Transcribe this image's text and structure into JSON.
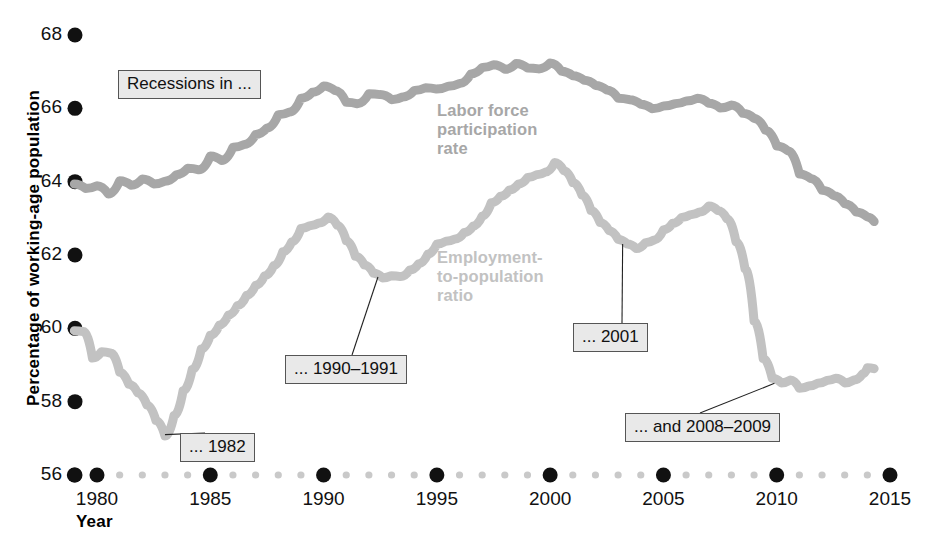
{
  "chart_data": {
    "type": "line",
    "title": "",
    "xlabel": "Year",
    "ylabel": "Percentage of working-age population",
    "xlim": [
      1979,
      2015
    ],
    "ylim": [
      56,
      68
    ],
    "grid": false,
    "legend_position": "inline-annotation",
    "xticks": [
      "1980",
      "1985",
      "1990",
      "1995",
      "2000",
      "2005",
      "2010",
      "2015"
    ],
    "xtick_values": [
      1980,
      1985,
      1990,
      1995,
      2000,
      2005,
      2010,
      2015
    ],
    "yticks": [
      "56",
      "58",
      "60",
      "62",
      "64",
      "66",
      "68"
    ],
    "ytick_values": [
      56,
      58,
      60,
      62,
      64,
      66,
      68
    ],
    "minor_x_step": 1,
    "series": [
      {
        "name": "Labor force participation rate",
        "color": "#a7a7a7",
        "x": [
          1979.0,
          1979.5,
          1980.0,
          1980.5,
          1981.0,
          1981.5,
          1982.0,
          1982.5,
          1983.0,
          1983.5,
          1984.0,
          1984.5,
          1985.0,
          1985.5,
          1986.0,
          1986.5,
          1987.0,
          1987.5,
          1988.0,
          1988.5,
          1989.0,
          1989.5,
          1990.0,
          1990.5,
          1991.0,
          1991.5,
          1992.0,
          1992.5,
          1993.0,
          1993.5,
          1994.0,
          1994.5,
          1995.0,
          1995.5,
          1996.0,
          1996.5,
          1997.0,
          1997.5,
          1998.0,
          1998.5,
          1999.0,
          1999.5,
          2000.0,
          2000.5,
          2001.0,
          2001.5,
          2002.0,
          2002.5,
          2003.0,
          2003.5,
          2004.0,
          2004.5,
          2005.0,
          2005.5,
          2006.0,
          2006.5,
          2007.0,
          2007.5,
          2008.0,
          2008.5,
          2009.0,
          2009.5,
          2010.0,
          2010.5,
          2011.0,
          2011.5,
          2012.0,
          2012.5,
          2013.0,
          2013.5,
          2014.0,
          2014.3
        ],
        "y": [
          63.9,
          63.8,
          63.9,
          63.7,
          64.0,
          63.9,
          64.1,
          63.9,
          64.0,
          64.2,
          64.4,
          64.3,
          64.7,
          64.6,
          64.9,
          65.0,
          65.3,
          65.5,
          65.8,
          65.9,
          66.3,
          66.4,
          66.6,
          66.5,
          66.2,
          66.1,
          66.4,
          66.4,
          66.2,
          66.3,
          66.5,
          66.6,
          66.5,
          66.6,
          66.7,
          66.9,
          67.1,
          67.2,
          67.1,
          67.2,
          67.1,
          67.1,
          67.2,
          67.0,
          66.9,
          66.8,
          66.6,
          66.5,
          66.3,
          66.2,
          66.1,
          66.0,
          66.1,
          66.1,
          66.2,
          66.3,
          66.1,
          66.0,
          66.1,
          65.9,
          65.7,
          65.4,
          65.0,
          64.8,
          64.2,
          64.1,
          63.8,
          63.6,
          63.4,
          63.2,
          63.0,
          62.9
        ],
        "y_start": 63.9,
        "y_end": 62.9,
        "peak": {
          "value": 67.3,
          "year_range": "1997-2000"
        }
      },
      {
        "name": "Employment-to-population ratio",
        "color": "#c2c2c2",
        "x": [
          1979.0,
          1979.4,
          1979.8,
          1980.2,
          1980.6,
          1981.0,
          1981.4,
          1981.8,
          1982.2,
          1982.6,
          1983.0,
          1983.4,
          1983.8,
          1984.2,
          1984.6,
          1985.0,
          1985.4,
          1985.8,
          1986.2,
          1986.6,
          1987.0,
          1987.4,
          1987.8,
          1988.2,
          1988.6,
          1989.0,
          1989.4,
          1989.8,
          1990.2,
          1990.6,
          1991.0,
          1991.4,
          1991.8,
          1992.2,
          1992.6,
          1993.0,
          1993.4,
          1993.8,
          1994.2,
          1994.6,
          1995.0,
          1995.4,
          1995.8,
          1996.2,
          1996.6,
          1997.0,
          1997.4,
          1997.8,
          1998.2,
          1998.6,
          1999.0,
          1999.4,
          1999.8,
          2000.2,
          2000.6,
          2001.0,
          2001.4,
          2001.8,
          2002.2,
          2002.6,
          2003.0,
          2003.4,
          2003.8,
          2004.2,
          2004.6,
          2005.0,
          2005.4,
          2005.8,
          2006.2,
          2006.6,
          2007.0,
          2007.4,
          2007.8,
          2008.2,
          2008.6,
          2009.0,
          2009.4,
          2009.8,
          2010.2,
          2010.6,
          2011.0,
          2011.4,
          2011.8,
          2012.2,
          2012.6,
          2013.0,
          2013.4,
          2013.8,
          2014.0,
          2014.3
        ],
        "y": [
          59.9,
          59.9,
          59.2,
          59.4,
          59.3,
          58.8,
          58.5,
          58.2,
          57.9,
          57.5,
          57.1,
          57.6,
          58.3,
          58.9,
          59.4,
          59.8,
          60.1,
          60.4,
          60.6,
          60.9,
          61.2,
          61.4,
          61.7,
          62.1,
          62.4,
          62.7,
          62.8,
          62.9,
          63.0,
          62.8,
          62.4,
          62.0,
          61.7,
          61.5,
          61.4,
          61.4,
          61.4,
          61.6,
          61.8,
          62.0,
          62.3,
          62.4,
          62.4,
          62.6,
          62.8,
          63.1,
          63.4,
          63.6,
          63.8,
          63.9,
          64.1,
          64.2,
          64.3,
          64.5,
          64.3,
          64.0,
          63.6,
          63.2,
          62.9,
          62.7,
          62.4,
          62.3,
          62.2,
          62.3,
          62.4,
          62.7,
          62.9,
          63.0,
          63.1,
          63.2,
          63.3,
          63.2,
          63.0,
          62.4,
          61.6,
          60.2,
          59.2,
          58.6,
          58.5,
          58.6,
          58.4,
          58.4,
          58.5,
          58.6,
          58.6,
          58.5,
          58.6,
          58.8,
          58.9,
          58.9
        ],
        "y_start": 59.9,
        "y_end": 58.9,
        "trough": {
          "value": 57.1,
          "year": 1983
        },
        "peak": {
          "value": 64.5,
          "year": 2000
        }
      }
    ],
    "annotations": [
      {
        "id": "recessions",
        "text": "Recessions in ...",
        "has_leader": false
      },
      {
        "id": "r1982",
        "text": "... 1982",
        "has_leader": true,
        "target_year": 1983.0,
        "target_value": 57.1
      },
      {
        "id": "r1990",
        "text": "... 1990–1991",
        "has_leader": true,
        "target_year": 1992.4,
        "target_value": 61.4
      },
      {
        "id": "r2001",
        "text": "... 2001",
        "has_leader": true,
        "target_year": 2003.2,
        "target_value": 62.3
      },
      {
        "id": "r2008",
        "text": "... and 2008–2009",
        "has_leader": true,
        "target_year": 2009.9,
        "target_value": 58.5
      }
    ]
  },
  "axes": {
    "y_title": "Percentage of working-age population",
    "x_title": "Year"
  },
  "series_labels": {
    "lfp_line1": "Labor force",
    "lfp_line2": "participation",
    "lfp_line3": "rate",
    "epop_line1": "Employment-",
    "epop_line2": "to-population",
    "epop_line3": "ratio"
  },
  "colors": {
    "lfp": "#a7a7a7",
    "epop": "#c2c2c2",
    "tick_major": "#111111",
    "tick_minor": "#c9c9c9",
    "callout_fill": "#e9e9e9",
    "callout_border": "#555555"
  }
}
